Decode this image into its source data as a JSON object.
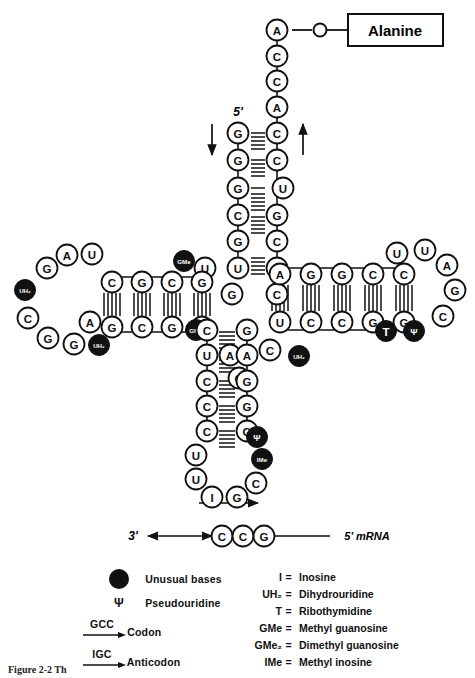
{
  "figure": {
    "amino_acid_label": "Alanine",
    "five_prime_label": "5'",
    "three_prime_label": "3'",
    "mrna_label": "5' mRNA",
    "caption": "Figure  2-2   Th"
  },
  "colors": {
    "ink": "#111111",
    "unusual_base_fill": "#111111",
    "unusual_base_text": "#ffffff",
    "normal_base_fill": "#ffffff",
    "paper": "#ffffff"
  },
  "acceptor_stem": {
    "three_prime_strand": [
      "A",
      "C",
      "C",
      "A",
      "C",
      "C",
      "U",
      "G",
      "C",
      "U",
      "C"
    ],
    "five_prime_strand": [
      "G",
      "G",
      "G",
      "C",
      "G",
      "U",
      "G"
    ],
    "paired": [
      true,
      true,
      false,
      true,
      true,
      false,
      true
    ]
  },
  "d_arm": {
    "stem_top": [
      "C",
      "G",
      "C",
      "G"
    ],
    "stem_bottom": [
      "G",
      "C",
      "G",
      "C"
    ],
    "loop": [
      "G",
      "A",
      "U",
      "UH2",
      "C",
      "G",
      "G",
      "UH2",
      "A"
    ]
  },
  "t_arm": {
    "stem_top": [
      "A",
      "G",
      "G",
      "C",
      "C"
    ],
    "stem_bottom": [
      "U",
      "C",
      "C",
      "G",
      "G"
    ],
    "loop": [
      "U",
      "U",
      "A",
      "G",
      "C",
      "Ψ",
      "T"
    ]
  },
  "anticodon_arm": {
    "stem_left": [
      "C",
      "U",
      "C",
      "C",
      "C"
    ],
    "stem_right": [
      "G",
      "A",
      "G",
      "G",
      "G"
    ],
    "loop": [
      "U",
      "U",
      "I",
      "G",
      "C",
      "IMe",
      "Ψ"
    ],
    "anticodon": "IGC"
  },
  "variable_loop": [
    "GMe",
    "C",
    "A",
    "G",
    "UH2",
    "C",
    "U"
  ],
  "junction": {
    "gme_upper": "GMe",
    "gme_lower": "GMe",
    "u_left": "U",
    "g_left": "G"
  },
  "mrna": {
    "bases": [
      "C",
      "C",
      "G"
    ],
    "codon": "GCC"
  },
  "legend_left": [
    {
      "symbol": "filled-circle",
      "label": "Unusual bases"
    },
    {
      "symbol": "Ψ",
      "label": "Pseudouridine"
    },
    {
      "symbol": "GCC",
      "label": "Codon"
    },
    {
      "symbol": "IGC",
      "label": "Anticodon"
    }
  ],
  "legend_right": [
    {
      "abbr": "I",
      "eq": "=",
      "meaning": "Inosine"
    },
    {
      "abbr": "UH₂",
      "eq": "=",
      "meaning": "Dihydrouridine"
    },
    {
      "abbr": "T",
      "eq": "=",
      "meaning": "Ribothymidine"
    },
    {
      "abbr": "GMe",
      "eq": "=",
      "meaning": "Methyl guanosine"
    },
    {
      "abbr": "GMe₂",
      "eq": "=",
      "meaning": "Dimethyl guanosine"
    },
    {
      "abbr": "IMe",
      "eq": "=",
      "meaning": "Methyl inosine"
    }
  ]
}
